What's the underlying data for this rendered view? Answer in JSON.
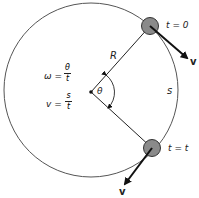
{
  "diagram": {
    "labels": {
      "radius": "R",
      "arc": "s",
      "angle": "θ",
      "start_time": "t = 0",
      "end_time": "t = t",
      "velocity_top": "v",
      "velocity_bottom": "v"
    },
    "formulas": {
      "omega": {
        "lhs": "ω =",
        "num": "θ",
        "den": "t"
      },
      "velocity": {
        "lhs": "v =",
        "num": "s",
        "den": "t"
      }
    },
    "colors": {
      "circle": "#555555",
      "ball_fill": "#8a8a8a",
      "ball_stroke": "#333333",
      "lines": "#222222"
    }
  }
}
